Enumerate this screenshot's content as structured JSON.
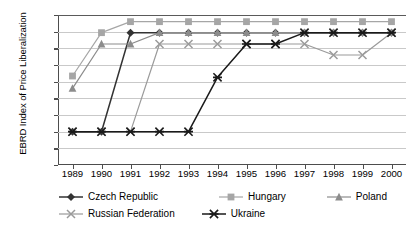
{
  "chart_data": {
    "type": "line",
    "title": "",
    "xlabel": "",
    "ylabel": "EBRD Index of Price Liberalization",
    "categories": [
      "1989",
      "1990",
      "1991",
      "1992",
      "1993",
      "1994",
      "1995",
      "1996",
      "1997",
      "1998",
      "1999",
      "2000"
    ],
    "x": [
      1989,
      1990,
      1991,
      1992,
      1993,
      1994,
      1995,
      1996,
      1997,
      1998,
      1999,
      2000
    ],
    "ylim": [
      0.0,
      4.5
    ],
    "ytick_labels": [
      "0.00",
      "0.50",
      "1.00",
      "1.50",
      "2.00",
      "2.50",
      "3.00",
      "3.50",
      "4.00",
      "4.50"
    ],
    "ytick_values": [
      0.0,
      0.5,
      1.0,
      1.5,
      2.0,
      2.5,
      3.0,
      3.5,
      4.0,
      4.5
    ],
    "grid": true,
    "legend_position": "bottom",
    "series": [
      {
        "name": "Czech Republic",
        "marker": "diamond",
        "color": "#333333",
        "values": [
          1.0,
          1.0,
          3.97,
          3.97,
          3.97,
          3.97,
          3.97,
          3.97,
          3.97,
          3.97,
          3.97,
          3.97
        ]
      },
      {
        "name": "Hungary",
        "marker": "square",
        "color": "#a6a6a6",
        "values": [
          2.67,
          3.97,
          4.3,
          4.3,
          4.3,
          4.3,
          4.3,
          4.3,
          4.3,
          4.3,
          4.3,
          4.3
        ]
      },
      {
        "name": "Poland",
        "marker": "triangle",
        "color": "#8c8c8c",
        "values": [
          2.3,
          3.63,
          3.63,
          3.97,
          3.97,
          3.97,
          3.97,
          3.97,
          3.97,
          3.97,
          3.97,
          3.97
        ]
      },
      {
        "name": "Russian Federation",
        "marker": "cross",
        "color": "#9a9a9a",
        "values": [
          1.0,
          1.0,
          1.0,
          3.63,
          3.63,
          3.63,
          3.63,
          3.63,
          3.63,
          3.3,
          3.3,
          3.97
        ]
      },
      {
        "name": "Ukraine",
        "marker": "asterisk",
        "color": "#1a1a1a",
        "values": [
          1.0,
          1.0,
          1.0,
          1.0,
          1.0,
          2.63,
          3.63,
          3.63,
          3.97,
          3.97,
          3.97,
          3.97
        ]
      }
    ]
  },
  "legend": {
    "row1": [
      "Czech Republic",
      "Hungary",
      "Poland"
    ],
    "row2": [
      "Russian Federation",
      "Ukraine"
    ]
  }
}
